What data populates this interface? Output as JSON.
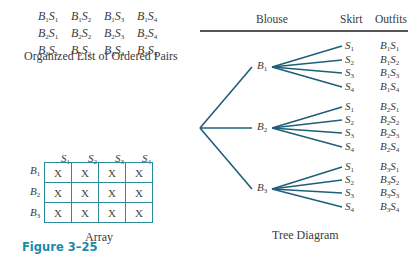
{
  "organized_list": {
    "rows": [
      [
        {
          "b": "1",
          "s": "1"
        },
        {
          "b": "1",
          "s": "2"
        },
        {
          "b": "1",
          "s": "3"
        },
        {
          "b": "1",
          "s": "4"
        }
      ],
      [
        {
          "b": "2",
          "s": "1"
        },
        {
          "b": "2",
          "s": "2"
        },
        {
          "b": "2",
          "s": "3"
        },
        {
          "b": "2",
          "s": "4"
        }
      ],
      [
        {
          "b": "3",
          "s": "1"
        },
        {
          "b": "3",
          "s": "2"
        },
        {
          "b": "3",
          "s": "3"
        },
        {
          "b": "3",
          "s": "4"
        }
      ]
    ],
    "caption": "Organized List of Ordered Pairs"
  },
  "array": {
    "col_headers": [
      "1",
      "2",
      "3",
      "4"
    ],
    "row_headers": [
      "1",
      "2",
      "3"
    ],
    "cell_mark": "X",
    "caption": "Array",
    "border_color": "#2a8a9a"
  },
  "figure_label": "Figure 3–25",
  "tree": {
    "headers": {
      "blouse": "Blouse",
      "skirt": "Skirt",
      "outfits": "Outfits"
    },
    "branch_color": "#1f5f78",
    "blouses": [
      {
        "b": "1",
        "skirts": [
          "1",
          "2",
          "3",
          "4"
        ]
      },
      {
        "b": "2",
        "skirts": [
          "1",
          "2",
          "3",
          "4"
        ]
      },
      {
        "b": "3",
        "skirts": [
          "1",
          "2",
          "3",
          "4"
        ]
      }
    ],
    "caption": "Tree Diagram"
  },
  "letters": {
    "B": "B",
    "S": "S"
  }
}
